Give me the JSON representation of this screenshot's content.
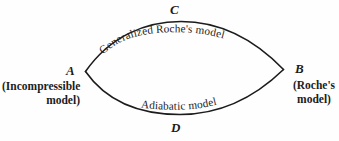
{
  "figure": {
    "background_color": "#fefefe",
    "ink_color": "#1c1c1c",
    "vertices": {
      "top": "C",
      "bottom": "D",
      "left": "A",
      "right": "B"
    },
    "left_annotation": {
      "line1": "(Incompressible",
      "line2": "model)"
    },
    "right_annotation": {
      "line1": "(Roche's",
      "line2": "model)"
    },
    "upper_path_label": "Generalized Roche's model",
    "lower_path_label": "Adiabatic model"
  }
}
